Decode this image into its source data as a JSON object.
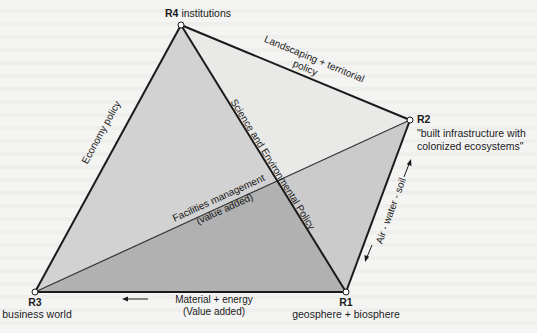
{
  "nodes": {
    "R4": {
      "id": "R4",
      "label": "institutions"
    },
    "R2": {
      "id": "R2",
      "label_line1": "\"built infrastructure with",
      "label_line2": "colonized ecosystems\""
    },
    "R3": {
      "id": "R3",
      "label": "business world"
    },
    "R1": {
      "id": "R1",
      "label": "geosphere + biosphere"
    }
  },
  "edges": {
    "r3_r4": "Economy policy",
    "r4_r2_line1": "Landscaping + territorial",
    "r4_r2_line2": "policy",
    "r4_r1": "Science and Environmental Policy",
    "r3_r2_line1": "Facilities management",
    "r3_r2_line2": "(value added)",
    "r1_r2": "Air - water - soil",
    "r3_r1_line1": "Material + energy",
    "r3_r1_line2": "(Value added)"
  },
  "colors": {
    "face_left_upper": "#d2d2d2",
    "face_left_lower": "#b1b1b1",
    "face_right_upper": "#e9e9e8",
    "face_right_lower": "#cbcbcb",
    "edge": "#1a1a1a",
    "node_fill": "#ffffff"
  }
}
